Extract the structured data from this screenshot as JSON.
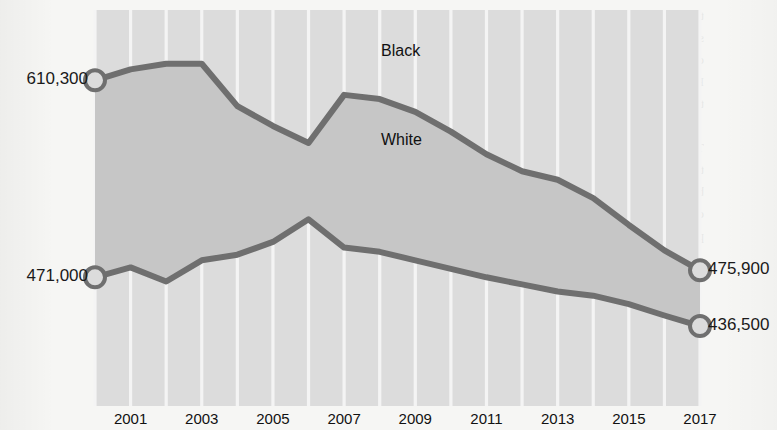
{
  "chart_data": {
    "type": "area",
    "title": "",
    "subtitle": "",
    "xlabel": "",
    "ylabel": "",
    "grid": "vertical-white-gridlines",
    "legend": "inline-labels",
    "x": [
      2000,
      2001,
      2002,
      2003,
      2004,
      2005,
      2006,
      2007,
      2008,
      2009,
      2010,
      2011,
      2012,
      2013,
      2014,
      2015,
      2016,
      2017
    ],
    "xlim": [
      2000,
      2017
    ],
    "ylim": [
      380000,
      660000
    ],
    "tick_labels": [
      "2001",
      "2003",
      "2005",
      "2007",
      "2009",
      "2011",
      "2013",
      "2015",
      "2017"
    ],
    "tick_values": [
      2001,
      2003,
      2005,
      2007,
      2009,
      2011,
      2013,
      2015,
      2017
    ],
    "series": [
      {
        "name": "Black",
        "label": "Black",
        "color": "#6f6f6f",
        "start_label": "610,300",
        "end_label": "475,900",
        "start_value": 610300,
        "end_value": 475900,
        "values": [
          610300,
          618000,
          622000,
          622000,
          592000,
          578000,
          566000,
          600000,
          597000,
          588000,
          574000,
          558000,
          546000,
          540000,
          527000,
          508000,
          490000,
          475900
        ]
      },
      {
        "name": "White",
        "label": "White",
        "color": "#6f6f6f",
        "start_label": "471,000",
        "end_label": "436,500",
        "start_value": 471000,
        "end_value": 436500,
        "values": [
          471000,
          478000,
          468000,
          483000,
          487000,
          496000,
          512000,
          492000,
          489000,
          483000,
          477000,
          471000,
          466000,
          461000,
          458000,
          452000,
          444000,
          436500
        ]
      }
    ],
    "markers": [
      {
        "series": "Black",
        "x": 2000,
        "value": 610300,
        "label": "610,300",
        "side": "left"
      },
      {
        "series": "White",
        "x": 2000,
        "value": 471000,
        "label": "471,000",
        "side": "left"
      },
      {
        "series": "Black",
        "x": 2017,
        "value": 475900,
        "label": "475,900",
        "side": "right"
      },
      {
        "series": "White",
        "x": 2017,
        "value": 436500,
        "label": "436,500",
        "side": "right"
      }
    ],
    "colors": {
      "plot_background": "#dcdcdc",
      "band_fill": "#c6c6c6",
      "line": "#6f6f6f",
      "gridline": "#f4f4f4",
      "marker_fill": "#dcdcdc",
      "marker_stroke": "#6f6f6f",
      "text": "#111111",
      "page_background": "#f6f6f4"
    }
  },
  "labels": {
    "left_top": "610,300",
    "left_bottom": "471,000",
    "right_top": "475,900",
    "right_bottom": "436,500",
    "series_black": "Black",
    "series_white": "White"
  },
  "xaxis": {
    "ticks": [
      {
        "label": "2001"
      },
      {
        "label": "2003"
      },
      {
        "label": "2005"
      },
      {
        "label": "2007"
      },
      {
        "label": "2009"
      },
      {
        "label": "2011"
      },
      {
        "label": "2013"
      },
      {
        "label": "2015"
      },
      {
        "label": "2017"
      }
    ]
  },
  "background_text": {
    "lines": [
      "the numbers of prisoners held in",
      "state and federal institutions, together with",
      "certain detainees, declined over the period.",
      "Rates for some groups fell more sharply",
      "than for others during these years.",
      "",
      "The figure opposite charts the trend. Note",
      "that while the overall totals declined, the gap",
      "between the two populations narrowed",
      "considerably, so that by the end of the",
      "period the two lines very nearly converge."
    ]
  }
}
